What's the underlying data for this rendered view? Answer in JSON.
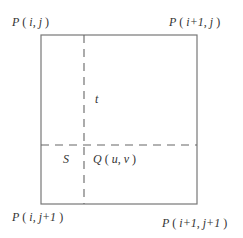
{
  "diagram": {
    "colors": {
      "line": "#777777",
      "dash": "#666666",
      "text": "#333333",
      "background": "#ffffff"
    },
    "corners": {
      "top_left": {
        "P": "P",
        "open": "(",
        "i": "i",
        "sep": ",",
        "j": "j",
        "close": ")"
      },
      "top_right": {
        "P": "P",
        "open": "(",
        "i": "i+1",
        "sep": ",",
        "j": "j",
        "close": ")"
      },
      "bottom_left": {
        "P": "P",
        "open": "(",
        "i": "i",
        "sep": ",",
        "j": "j+1",
        "close": ")"
      },
      "bottom_right": {
        "P": "P",
        "open": "(",
        "i": "i+1",
        "sep": ",",
        "j": "j+1",
        "close": ")"
      }
    },
    "interior": {
      "t_label": "t",
      "s_label": "S",
      "q_point": {
        "Q": "Q",
        "open": "(",
        "u": "u",
        "sep": ",",
        "v": "v",
        "close": ")"
      }
    }
  }
}
